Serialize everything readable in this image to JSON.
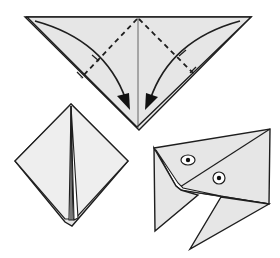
{
  "diagram": {
    "type": "origami-instructions",
    "steps": [
      {
        "id": "step-1",
        "description": "Triangle with valley-fold dashed lines; fold side corners down to the bottom point",
        "elements": [
          "triangle",
          "center-crease",
          "dashed-fold-lines",
          "curved-arrows"
        ]
      },
      {
        "id": "step-2",
        "description": "Resulting diamond (square base) with center slits",
        "elements": [
          "diamond",
          "center-slits"
        ]
      },
      {
        "id": "step-3",
        "description": "Finished fish/frog head with open mouth and two eyes",
        "elements": [
          "head-shape",
          "mouth",
          "eyes"
        ]
      }
    ],
    "colors": {
      "paper": "#e6e6e6",
      "outline": "#1e1e1e",
      "background": "#ffffff"
    }
  }
}
